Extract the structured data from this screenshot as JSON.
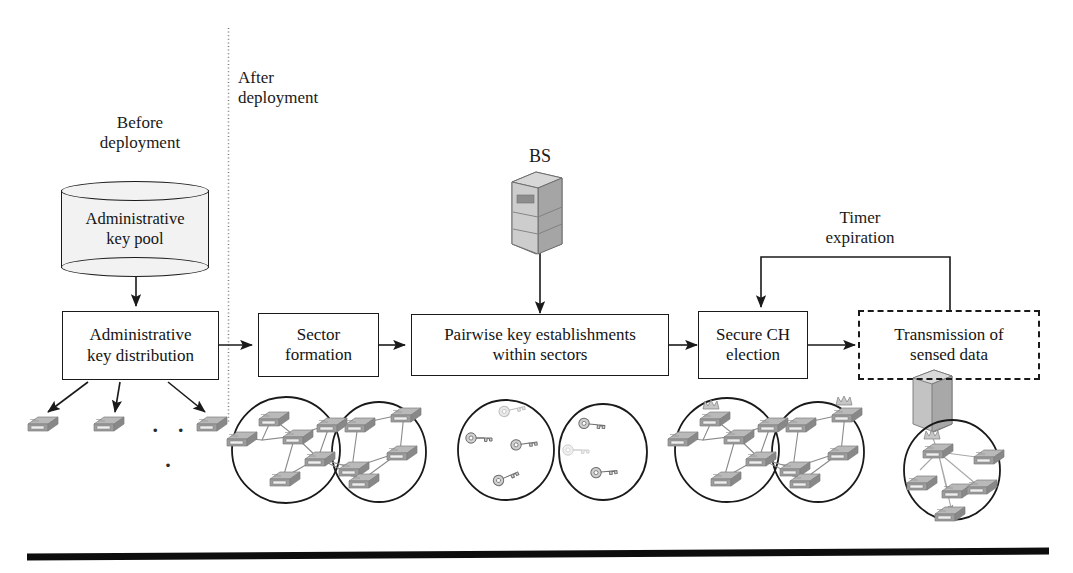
{
  "diagram": {
    "phase_labels": {
      "before": "Before\ndeployment",
      "after": "After\ndeployment"
    },
    "base_station_label": "BS",
    "feedback_label": "Timer\nexpiration",
    "ellipsis": "· · ·",
    "steps": [
      {
        "id": "admin-key-pool",
        "label": "Administrative\nkey pool",
        "shape": "cylinder"
      },
      {
        "id": "admin-key-distribution",
        "label": "Administrative\nkey distribution",
        "shape": "rect"
      },
      {
        "id": "sector-formation",
        "label": "Sector\nformation",
        "shape": "rect"
      },
      {
        "id": "pairwise-key-establishments",
        "label": "Pairwise key establishments\nwithin sectors",
        "shape": "rect"
      },
      {
        "id": "secure-ch-election",
        "label": "Secure CH\nelection",
        "shape": "rect"
      },
      {
        "id": "transmission-sensed-data",
        "label": "Transmission of\nsensed data",
        "shape": "rect-dashed"
      }
    ],
    "illustrations": [
      {
        "id": "distributed-nodes",
        "caption": "Three sensor nodes receiving keys"
      },
      {
        "id": "sector-clusters",
        "caption": "Two overlapping sectors of connected sensor nodes"
      },
      {
        "id": "key-sectors",
        "caption": "Two sectors containing pairwise keys"
      },
      {
        "id": "ch-clusters",
        "caption": "Two sectors with elected cluster heads"
      },
      {
        "id": "data-transmission",
        "caption": "Cluster nodes transmitting sensed data to the base station"
      }
    ],
    "colors": {
      "stroke": "#1a1a1a",
      "cylinder_fill": "#f2f2f2",
      "node_gray": "#9a9a9a",
      "divider": "#7b7b7b",
      "rule": "#0d0d0d"
    }
  }
}
